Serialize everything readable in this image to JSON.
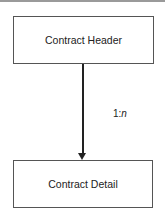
{
  "diagram": {
    "nodes": [
      {
        "id": "contract-header",
        "label": "Contract Header"
      },
      {
        "id": "contract-detail",
        "label": "Contract Detail"
      }
    ],
    "edges": [
      {
        "from": "contract-header",
        "to": "contract-detail",
        "label_prefix": "1:",
        "label_suffix": "n"
      }
    ]
  }
}
